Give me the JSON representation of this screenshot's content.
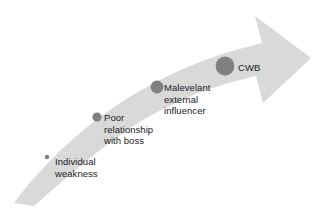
{
  "diagram": {
    "type": "escalation-arrow",
    "background_color": "#ffffff",
    "arrow": {
      "name": "upward-curved-arrow",
      "fill_color": "#d9d9d9",
      "direction": "bottom-left to top-right",
      "description": "curved tapering band ending in a right-pointing arrowhead"
    },
    "marker_color": "#808080",
    "text_color": "#1a1a1a",
    "stages": [
      {
        "id": "individual-weakness",
        "label_lines": [
          "Individual",
          "weakness"
        ],
        "line1": "Individual",
        "line2": "weakness",
        "marker_size_px": 4,
        "marker_x": 47,
        "marker_y": 157
      },
      {
        "id": "poor-relationship",
        "label_lines": [
          "Poor",
          "relationship",
          "with boss"
        ],
        "line1": "Poor",
        "line2": "relationship",
        "line3": "with boss",
        "marker_size_px": 9,
        "marker_x": 97,
        "marker_y": 117
      },
      {
        "id": "malevolent-influencer",
        "label_lines": [
          "Malevelant",
          "external",
          "influencer"
        ],
        "line1": "Malevelant",
        "line2": "external",
        "line3": "influencer",
        "marker_size_px": 13,
        "marker_x": 157,
        "marker_y": 87
      },
      {
        "id": "cwb",
        "label_lines": [
          "CWB"
        ],
        "line1": "CWB",
        "marker_size_px": 19,
        "marker_x": 225,
        "marker_y": 66
      }
    ]
  }
}
